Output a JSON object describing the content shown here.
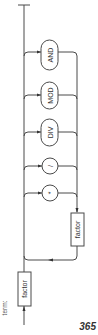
{
  "diagram": {
    "rule_name": "term:",
    "entry_nonterminal": "factor",
    "loop_nonterminal": "factor",
    "operators": [
      {
        "label": "AND",
        "shape": "oval"
      },
      {
        "label": "MOD",
        "shape": "oval"
      },
      {
        "label": "DIV",
        "shape": "oval"
      },
      {
        "label": "/",
        "shape": "circle"
      },
      {
        "label": "*",
        "shape": "circle"
      }
    ],
    "orientation": "rotated-90-clockwise",
    "line_color": "#4a4a4a"
  },
  "page": {
    "number": "365"
  }
}
